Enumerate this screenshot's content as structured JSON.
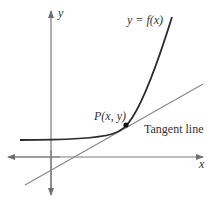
{
  "figure": {
    "labels": {
      "y_axis": "y",
      "x_axis": "x",
      "curve": "y = f(x)",
      "point": "P(x, y)",
      "tangent": "Tangent line"
    },
    "colors": {
      "axis": "#7a7a7a",
      "curve": "#2b2b2b",
      "tangent": "#8a8a8a",
      "point": "#111111",
      "text": "#333333"
    }
  }
}
